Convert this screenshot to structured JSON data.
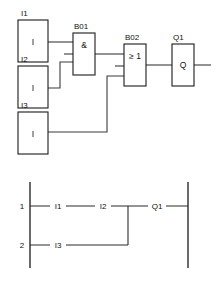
{
  "diagram": {
    "fbd": {
      "name": "function-block-diagram",
      "inputs": [
        {
          "id": "I1",
          "tag": "I1",
          "glyph": "I",
          "name": "input-block-i1"
        },
        {
          "id": "I2",
          "tag": "I2",
          "glyph": "I",
          "name": "input-block-i2"
        },
        {
          "id": "I3",
          "tag": "I3",
          "glyph": "I",
          "name": "input-block-i3"
        }
      ],
      "logic": [
        {
          "id": "B01",
          "tag": "B01",
          "glyph": "&",
          "type": "AND",
          "name": "logic-block-b01"
        },
        {
          "id": "B02",
          "tag": "B02",
          "glyph": "≥ 1",
          "type": "OR",
          "name": "logic-block-b02"
        }
      ],
      "outputs": [
        {
          "id": "Q1",
          "tag": "Q1",
          "glyph": "Q",
          "name": "output-block-q1"
        }
      ]
    },
    "ladder": {
      "name": "ladder-diagram",
      "rows": [
        {
          "number": "1",
          "contacts": [
            "I1",
            "I2"
          ],
          "coil": "Q1"
        },
        {
          "number": "2",
          "contacts": [
            "I3"
          ],
          "coil": ""
        }
      ],
      "row_numbers": [
        "1",
        "2"
      ],
      "contact_labels": [
        "I1",
        "I2",
        "I3"
      ],
      "coil_label": "Q1"
    },
    "colors": {
      "line": "#1a1a1a",
      "wire": "#3b3b3b",
      "background": "#ffffff"
    }
  }
}
